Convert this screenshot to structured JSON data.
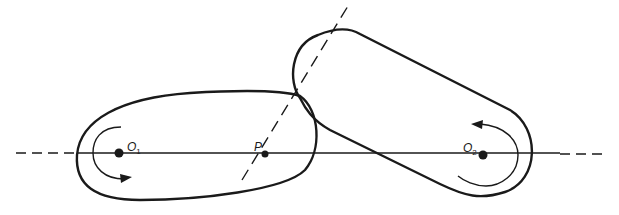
{
  "diagram": {
    "type": "rolling-contact-cams",
    "colors": {
      "stroke": "#1a1a1a",
      "background": "#ffffff"
    },
    "labels": {
      "o1": {
        "main": "O",
        "sub": "1"
      },
      "p": {
        "main": "P"
      },
      "o2": {
        "main": "O",
        "sub": "2"
      }
    },
    "elements": [
      "line-of-centers (dash-dot, horizontal)",
      "common-tangent (dashed, through P)",
      "cam-1 (left, rotating clockwise about O1)",
      "cam-2 (right, rotating counterclockwise about O2)"
    ]
  }
}
